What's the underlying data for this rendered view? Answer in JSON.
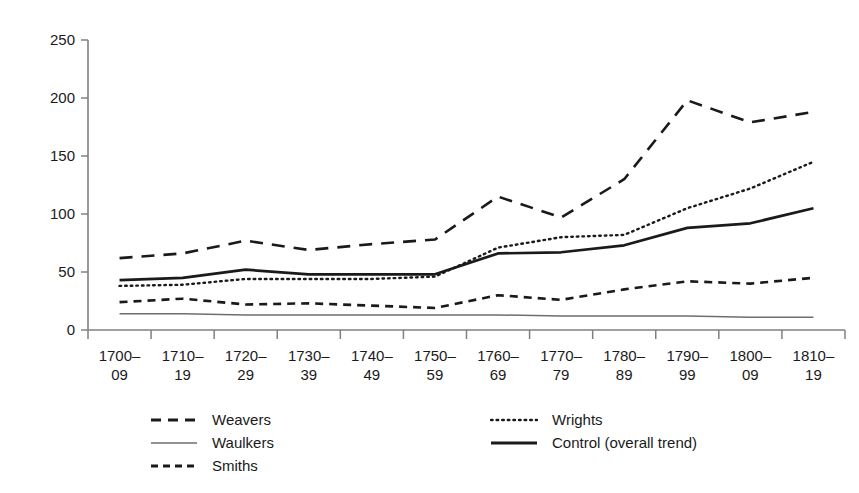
{
  "chart_data": {
    "type": "line",
    "title": "",
    "subtitle": "",
    "xlabel": "",
    "ylabel": "",
    "grid": false,
    "legend_position": "bottom",
    "ylim": [
      0,
      250
    ],
    "yticks": [
      0,
      50,
      100,
      150,
      200,
      250
    ],
    "categories": [
      "1700–09",
      "1710–19",
      "1720–29",
      "1730–39",
      "1740–49",
      "1750–59",
      "1760–69",
      "1770–79",
      "1780–89",
      "1790–99",
      "1800–09",
      "1810–19"
    ],
    "series": [
      {
        "name": "Weavers",
        "style": "long-dash",
        "values": [
          62,
          66,
          77,
          69,
          74,
          78,
          115,
          97,
          130,
          198,
          179,
          188
        ]
      },
      {
        "name": "Waulkers",
        "style": "thin-solid",
        "values": [
          14,
          14,
          13,
          13,
          13,
          13,
          13,
          12,
          12,
          12,
          11,
          11
        ]
      },
      {
        "name": "Smiths",
        "style": "short-dash",
        "values": [
          24,
          27,
          22,
          23,
          21,
          19,
          30,
          26,
          35,
          42,
          40,
          45
        ]
      },
      {
        "name": "Wrights",
        "style": "dotted",
        "values": [
          38,
          39,
          44,
          44,
          44,
          46,
          71,
          80,
          82,
          105,
          122,
          145
        ]
      },
      {
        "name": "Control (overall trend)",
        "style": "thick-solid",
        "values": [
          43,
          45,
          52,
          48,
          48,
          48,
          66,
          67,
          73,
          88,
          92,
          105
        ]
      }
    ]
  },
  "axes": {
    "ytick_labels": [
      "250",
      "200",
      "150",
      "100",
      "50",
      "0"
    ]
  },
  "legend": {
    "columns": [
      {
        "entries": [
          {
            "label": "Weavers",
            "style": "long-dash"
          },
          {
            "label": "Waulkers",
            "style": "thin-solid"
          },
          {
            "label": "Smiths",
            "style": "short-dash"
          }
        ]
      },
      {
        "entries": [
          {
            "label": "Wrights",
            "style": "dotted"
          },
          {
            "label": "Control (overall trend)",
            "style": "thick-solid"
          }
        ]
      }
    ]
  }
}
